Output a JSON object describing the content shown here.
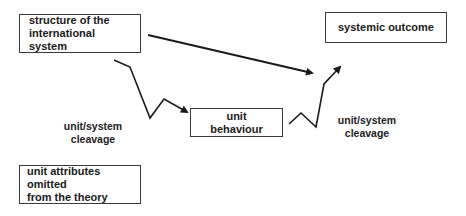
{
  "diagram": {
    "nodes": {
      "structure": {
        "label": "structure of the\ninternational system"
      },
      "outcome": {
        "label": "systemic outcome"
      },
      "behaviour": {
        "label": "unit behaviour"
      },
      "omitted": {
        "label": "unit attributes omitted\nfrom the theory"
      }
    },
    "labels": {
      "cleavage_left": "unit/system\ncleavage",
      "cleavage_right": "unit/system\ncleavage"
    },
    "edges": [
      {
        "from": "structure",
        "to": "outcome",
        "style": "straight-arrow"
      },
      {
        "from": "structure",
        "to": "behaviour",
        "style": "zigzag-arrow",
        "note": "crosses unit/system cleavage"
      },
      {
        "from": "behaviour",
        "to": "outcome",
        "style": "zigzag-arrow",
        "note": "crosses unit/system cleavage"
      }
    ],
    "colors": {
      "line": "#1a1a1a",
      "border": "#3a3a3a",
      "background": "#ffffff"
    }
  }
}
